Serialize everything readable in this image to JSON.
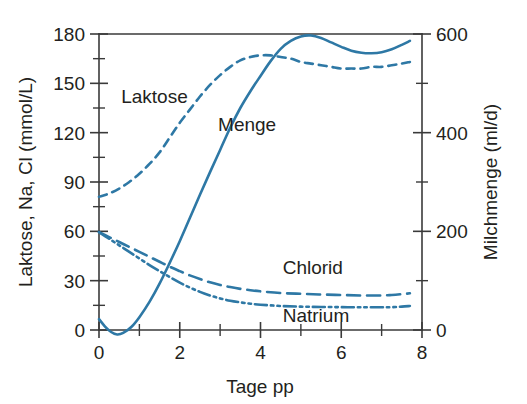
{
  "chart_data": {
    "type": "line",
    "title": "",
    "xlabel": "Tage pp",
    "ylabel": "Laktose, Na, Cl (mmol/L)",
    "y2label": "Milchmenge (ml/d)",
    "xlim": [
      0,
      8
    ],
    "ylim": [
      0,
      180
    ],
    "y2lim": [
      0,
      600
    ],
    "grid": false,
    "legend": "inline-labels",
    "xticks": [
      0,
      2,
      4,
      6,
      8
    ],
    "xtick_labels": [
      "0",
      "2",
      "4",
      "6",
      "8"
    ],
    "xticks_minor": [
      1,
      3,
      5,
      7
    ],
    "yticks": [
      0,
      30,
      60,
      90,
      120,
      150,
      180
    ],
    "ytick_labels": [
      "0",
      "30",
      "60",
      "90",
      "120",
      "150",
      "180"
    ],
    "yticks_minor": [
      15,
      45,
      75,
      105,
      135,
      165
    ],
    "y2ticks": [
      0,
      200,
      400,
      600
    ],
    "y2tick_labels": [
      "0",
      "200",
      "400",
      "600"
    ],
    "y2ticks_minor": [
      100,
      300,
      500
    ],
    "series": [
      {
        "name": "Laktose",
        "label": "Laktose",
        "axis": "left",
        "unit": "mmol/L",
        "style": "dashed",
        "color": "#2e78a5",
        "label_x": 0.55,
        "label_y": 138,
        "x": [
          0.0,
          0.25,
          0.5,
          0.75,
          1.0,
          1.25,
          1.5,
          1.75,
          2.0,
          2.25,
          2.5,
          2.75,
          3.0,
          3.25,
          3.5,
          3.75,
          4.0,
          4.25,
          4.5,
          4.75,
          5.0,
          5.25,
          5.5,
          5.75,
          6.0,
          6.25,
          6.5,
          6.75,
          7.0,
          7.25,
          7.5,
          7.7
        ],
        "y": [
          81,
          83,
          86,
          90,
          95,
          101,
          108,
          117,
          126,
          134,
          142,
          149,
          155,
          160,
          164,
          166,
          167,
          167,
          166,
          165,
          163,
          162,
          161,
          160,
          159,
          159,
          159,
          160,
          160,
          161,
          162,
          163
        ]
      },
      {
        "name": "Menge",
        "label": "Menge",
        "axis": "right",
        "unit": "ml/d",
        "style": "solid",
        "color": "#2e78a5",
        "label_x": 2.95,
        "label_y": 121,
        "x": [
          0.0,
          0.15,
          0.3,
          0.45,
          0.6,
          0.8,
          1.0,
          1.25,
          1.5,
          1.75,
          2.0,
          2.25,
          2.5,
          2.75,
          3.0,
          3.25,
          3.5,
          3.75,
          4.0,
          4.25,
          4.5,
          4.75,
          5.0,
          5.25,
          5.5,
          5.75,
          6.0,
          6.25,
          6.5,
          6.75,
          7.0,
          7.25,
          7.5,
          7.7
        ],
        "y_right": [
          22,
          7,
          -4,
          -9,
          -6,
          6,
          26,
          57,
          94,
          136,
          180,
          227,
          274,
          320,
          365,
          410,
          450,
          484,
          515,
          545,
          570,
          586,
          595,
          597,
          592,
          583,
          574,
          566,
          562,
          561,
          563,
          569,
          578,
          586
        ],
        "y": [
          6.6,
          2.1,
          -1.2,
          -2.7,
          -1.8,
          1.8,
          7.8,
          17.1,
          28.2,
          40.8,
          54.0,
          68.1,
          82.2,
          96.0,
          109.5,
          123.0,
          135.0,
          145.2,
          154.5,
          163.5,
          171.0,
          175.8,
          178.5,
          179.1,
          177.6,
          174.9,
          172.2,
          169.8,
          168.6,
          168.3,
          168.9,
          170.7,
          173.4,
          175.8
        ]
      },
      {
        "name": "Chlorid",
        "label": "Chlorid",
        "axis": "left",
        "unit": "mmol/L",
        "style": "long-dashed",
        "color": "#2e78a5",
        "label_x": 4.55,
        "label_y": 34,
        "x": [
          0.0,
          0.25,
          0.5,
          0.75,
          1.0,
          1.25,
          1.5,
          1.75,
          2.0,
          2.25,
          2.5,
          2.75,
          3.0,
          3.25,
          3.5,
          3.75,
          4.0,
          4.5,
          5.0,
          5.5,
          6.0,
          6.5,
          7.0,
          7.25,
          7.5,
          7.7
        ],
        "y": [
          59.5,
          56.5,
          53.5,
          50.5,
          47.5,
          44.5,
          41.5,
          38.5,
          35.8,
          33.2,
          31.0,
          29.0,
          27.4,
          26.1,
          25.0,
          24.2,
          23.5,
          22.5,
          22.0,
          21.6,
          21.3,
          21.0,
          21.0,
          21.3,
          21.8,
          22.3
        ]
      },
      {
        "name": "Natrium",
        "label": "Natrium",
        "axis": "left",
        "unit": "mmol/L",
        "style": "dash-dot-dot",
        "color": "#2e78a5",
        "label_x": 4.55,
        "label_y": 5,
        "x": [
          0.0,
          0.25,
          0.5,
          0.75,
          1.0,
          1.25,
          1.5,
          1.75,
          2.0,
          2.25,
          2.5,
          2.75,
          3.0,
          3.25,
          3.5,
          3.75,
          4.0,
          4.5,
          5.0,
          5.5,
          6.0,
          6.5,
          7.0,
          7.25,
          7.5,
          7.7
        ],
        "y": [
          59.5,
          55.5,
          51.5,
          47.5,
          43.5,
          39.5,
          35.8,
          32.2,
          28.8,
          25.8,
          23.2,
          21.0,
          19.2,
          17.8,
          16.8,
          16.0,
          15.4,
          14.6,
          14.2,
          14.0,
          13.9,
          13.8,
          13.8,
          13.9,
          14.2,
          14.6
        ]
      }
    ]
  },
  "axes": {
    "left_title": "Laktose, Na, Cl (mmol/L)",
    "right_title": "Milchmenge (ml/d)",
    "bottom_title": "Tage pp"
  },
  "labels": {
    "laktose": "Laktose",
    "menge": "Menge",
    "chlorid": "Chlorid",
    "natrium": "Natrium"
  },
  "ticks": {
    "left": [
      "180",
      "150",
      "120",
      "90",
      "60",
      "30",
      "0"
    ],
    "right": [
      "600",
      "400",
      "200",
      "0"
    ],
    "bottom": [
      "0",
      "2",
      "4",
      "6",
      "8"
    ]
  },
  "colors": {
    "series": "#2e78a5",
    "axis": "#3a3a3a",
    "text": "#231f20",
    "background": "#ffffff"
  }
}
